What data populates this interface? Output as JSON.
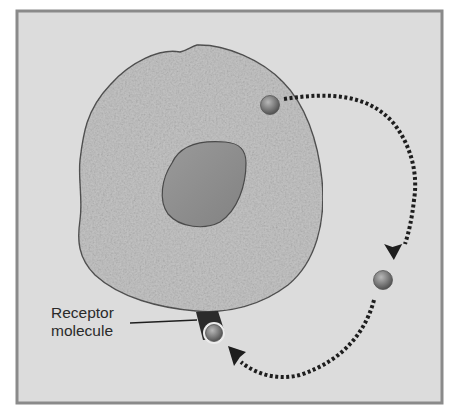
{
  "diagram": {
    "type": "cell signaling illustration",
    "labels": {
      "receptor_line1": "Receptor",
      "receptor_line2": "molecule"
    },
    "elements": [
      {
        "id": "cell",
        "description": "Large textured cell body with irregular outline"
      },
      {
        "id": "nucleus",
        "description": "Darker egg-shaped nucleus inside the cell"
      },
      {
        "id": "signal-molecule-inside",
        "description": "Small sphere inside the cell near upper right edge"
      },
      {
        "id": "signal-molecule-travelling",
        "description": "Small sphere outside the cell on the right"
      },
      {
        "id": "receptor",
        "description": "Dark receptor on the lower cell membrane with bound sphere"
      },
      {
        "id": "dotted-path",
        "description": "Dotted arrow path from inner molecule, out around right side, back to receptor"
      }
    ],
    "colors": {
      "frame_border": "#8a8a8a",
      "background": "#dcdcdc",
      "cell_fill": "#c4c4c4",
      "cell_outline": "#555555",
      "nucleus_fill": "#8e8e8e",
      "sphere": "#7a7a7a",
      "receptor": "#2b2b2b",
      "path": "#1e1e1e"
    }
  }
}
